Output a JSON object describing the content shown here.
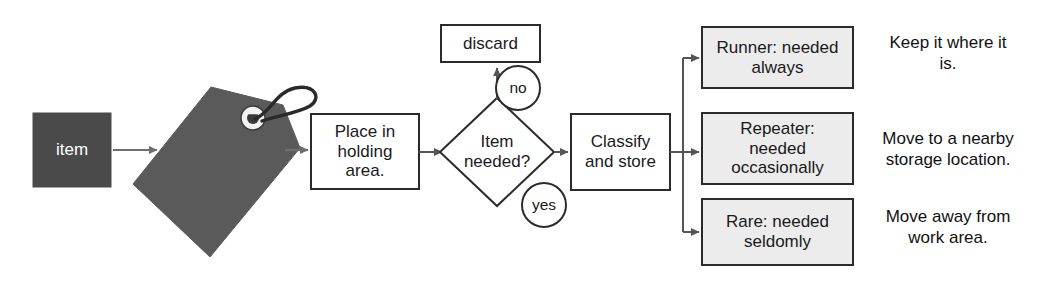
{
  "diagram": {
    "type": "flowchart",
    "colors": {
      "item_box_fill": "#4a4a4a",
      "item_box_text": "#ffffff",
      "tag_fill": "#5a5a5a",
      "result_box_fill": "#ececec",
      "process_box_fill": "#ffffff",
      "stroke": "#2b2b2b",
      "arrow": "#6e6e6e",
      "background": "#ffffff"
    },
    "nodes": {
      "item": {
        "label": "item",
        "shape": "rectangle",
        "style": "filled-dark"
      },
      "red_tag": {
        "label": "",
        "shape": "tag",
        "style": "filled-gray",
        "icon": "red-tag-icon"
      },
      "place_holding": {
        "label": "Place in\nholding\narea.",
        "shape": "rectangle",
        "style": "outlined"
      },
      "item_needed": {
        "label": "Item\nneeded?",
        "shape": "diamond",
        "style": "outlined"
      },
      "discard": {
        "label": "discard",
        "shape": "rectangle",
        "style": "outlined"
      },
      "classify_store": {
        "label": "Classify\nand store",
        "shape": "rectangle",
        "style": "outlined"
      },
      "runner": {
        "label": "Runner: needed\nalways",
        "shape": "rectangle",
        "style": "filled-light"
      },
      "repeater": {
        "label": "Repeater:\nneeded\noccasionally",
        "shape": "rectangle",
        "style": "filled-light"
      },
      "rare": {
        "label": "Rare: needed\nseldomly",
        "shape": "rectangle",
        "style": "filled-light"
      }
    },
    "edge_labels": {
      "no": "no",
      "yes": "yes"
    },
    "annotations": {
      "runner_action": "Keep it where it\nis.",
      "repeater_action": "Move to a nearby\nstorage location.",
      "rare_action": "Move away from\nwork area."
    }
  }
}
